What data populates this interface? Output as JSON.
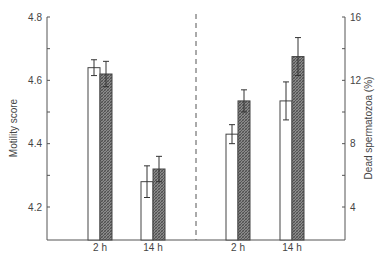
{
  "chart_data": {
    "type": "bar",
    "title": "",
    "xlabel": "",
    "left_axis": {
      "label": "Motility score",
      "ylim": [
        4.1,
        4.8
      ],
      "ticks": [
        "4.8",
        "4.6",
        "4.4",
        "4.2"
      ],
      "tick_values": [
        4.8,
        4.6,
        4.4,
        4.2
      ]
    },
    "right_axis": {
      "label": "Dead spermatozoa (%)",
      "ylim": [
        1.8,
        16
      ],
      "ticks": [
        "16",
        "12",
        "8",
        "4"
      ],
      "tick_values": [
        16,
        12,
        8,
        4
      ]
    },
    "panels": [
      {
        "name": "Motility score",
        "axis": "left",
        "categories": [
          "2h",
          "14h"
        ],
        "series": [
          {
            "name": "open bars",
            "fill": "#ffffff",
            "values": [
              4.64,
              4.28
            ],
            "err": [
              0.025,
              0.05
            ]
          },
          {
            "name": "hatched bars",
            "fill": "#777777",
            "values": [
              4.62,
              4.32
            ],
            "err": [
              0.04,
              0.04
            ]
          }
        ]
      },
      {
        "name": "Dead spermatozoa (%)",
        "axis": "right",
        "categories": [
          "2h",
          "14h"
        ],
        "series": [
          {
            "name": "open bars",
            "fill": "#ffffff",
            "values": [
              8.6,
              10.7
            ],
            "err": [
              0.6,
              1.2
            ]
          },
          {
            "name": "hatched bars",
            "fill": "#777777",
            "values": [
              10.7,
              13.5
            ],
            "err": [
              0.7,
              1.2
            ]
          }
        ]
      }
    ],
    "x_tick_labels": [
      "2 h",
      "14 h",
      "2 h",
      "14 h"
    ],
    "divider": "dashed vertical line between panels",
    "grid": false,
    "legend": null
  }
}
